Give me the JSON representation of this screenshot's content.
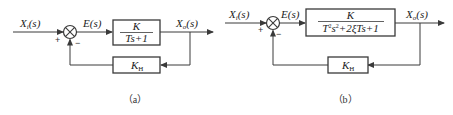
{
  "diagrams": [
    {
      "id": "a",
      "caption": "（a）",
      "input_label": "X_i(s)",
      "input_main": "X",
      "input_sub": "i",
      "input_arg": "(s)",
      "error_label": "E(s)",
      "output_main": "X",
      "output_sub": "o",
      "output_arg": "(s)",
      "plus_sign": "+",
      "minus_sign": "−",
      "forward_block": {
        "numerator": "K",
        "denominator": "Ts+1"
      },
      "feedback_block": {
        "main": "K",
        "sub": "H"
      }
    },
    {
      "id": "b",
      "caption": "（b）",
      "input_main": "X",
      "input_sub": "i",
      "input_arg": "(s)",
      "error_label": "E(s)",
      "output_main": "X",
      "output_sub": "o",
      "output_arg": "(s)",
      "plus_sign": "+",
      "minus_sign": "−",
      "forward_block": {
        "numerator": "K",
        "den_a": "T",
        "den_a_sup": "2",
        "den_b": "s",
        "den_b_sup": "2",
        "den_c": "+2ξTs+1"
      },
      "feedback_block": {
        "main": "K",
        "sub": "H"
      }
    }
  ]
}
